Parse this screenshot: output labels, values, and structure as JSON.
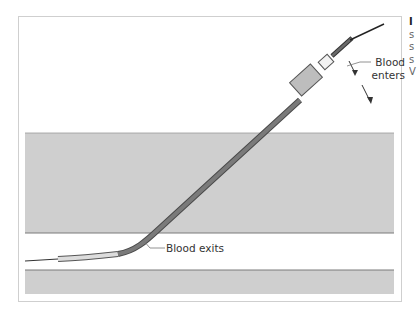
{
  "figure": {
    "labels": {
      "blood_enters_line1": "Blood",
      "blood_enters_line2": "enters",
      "blood_exits": "Blood exits"
    },
    "side_caption_fragment": [
      "I",
      "s",
      "s",
      "s",
      "V"
    ],
    "colors": {
      "tissue_band": "#cfcfcf",
      "vessel_lumen": "#ffffff",
      "catheter_dark": "#6e6e6e",
      "catheter_light": "#dcdcdc",
      "hub": "#bdbdbd",
      "needle": "#222222",
      "frame_border": "#cfcfcf"
    }
  }
}
